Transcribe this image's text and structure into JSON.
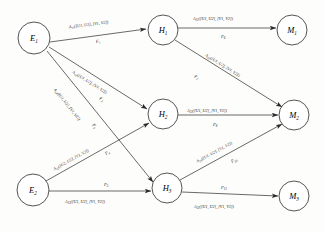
{
  "diagram": {
    "type": "directed-graph",
    "background_color": "#fdfdfb",
    "stroke_color": "#2a2a2a",
    "nodes": [
      {
        "id": "E1",
        "base": "E",
        "sub": "1",
        "label": "E1",
        "cx": 34,
        "cy": 38,
        "r": 16,
        "layer": "source"
      },
      {
        "id": "E2",
        "base": "E",
        "sub": "2",
        "label": "E2",
        "cx": 33,
        "cy": 190,
        "r": 16,
        "layer": "source"
      },
      {
        "id": "H1",
        "base": "H",
        "sub": "1",
        "label": "H1",
        "cx": 163,
        "cy": 30,
        "r": 15,
        "layer": "hidden"
      },
      {
        "id": "H2",
        "base": "H",
        "sub": "2",
        "label": "H2",
        "cx": 163,
        "cy": 114,
        "r": 15,
        "layer": "hidden"
      },
      {
        "id": "H3",
        "base": "H",
        "sub": "3",
        "label": "H3",
        "cx": 167,
        "cy": 188,
        "r": 15,
        "layer": "hidden"
      },
      {
        "id": "M1",
        "base": "M",
        "sub": "1",
        "label": "M1",
        "cx": 292,
        "cy": 30,
        "r": 15,
        "layer": "sink"
      },
      {
        "id": "M2",
        "base": "M",
        "sub": "2",
        "label": "M2",
        "cx": 294,
        "cy": 115,
        "r": 15,
        "layer": "sink"
      },
      {
        "id": "M3",
        "base": "M",
        "sub": "3",
        "label": "M3",
        "cx": 294,
        "cy": 196,
        "r": 15,
        "layer": "sink"
      }
    ],
    "edges": [
      {
        "id": "e1",
        "from": "E1",
        "to": "H1",
        "flow": "F",
        "flow_sub": "1",
        "attr_base": "A",
        "attr_sub": "11",
        "attr_args": "([U1, U2], [V1, V2])",
        "attr_text": "A11([U1, U2], [V1, V2])"
      },
      {
        "id": "e2",
        "from": "E1",
        "to": "H2",
        "flow": "F",
        "flow_sub": "2",
        "attr_base": "A",
        "attr_sub": "12",
        "attr_args": "([U1, U2], [V1, V2])",
        "attr_text": "A12([U1, U2], [V1, V2])"
      },
      {
        "id": "e3",
        "from": "E1",
        "to": "H3",
        "flow": "F",
        "flow_sub": "3",
        "attr_base": "A",
        "attr_sub": "13",
        "attr_args": "([U1, U2], [V1, V2])",
        "attr_text": "A13([U1, U2], [V1, V2])"
      },
      {
        "id": "e4",
        "from": "E2",
        "to": "H2",
        "flow": "F",
        "flow_sub": "4",
        "attr_base": "A",
        "attr_sub": "22",
        "attr_args": "([U2, U2], [V1, V2])",
        "attr_text": "A22([U2, U2], [V1, V2])"
      },
      {
        "id": "e5",
        "from": "E2",
        "to": "H3",
        "flow": "F",
        "flow_sub": "5",
        "attr_base": "A",
        "attr_sub": "13",
        "attr_args": "([U1, U2], [V1, V2])",
        "attr_text": "A13([U1, U2], [V1, V2])"
      },
      {
        "id": "e6",
        "from": "H1",
        "to": "M1",
        "flow": "F",
        "flow_sub": "6",
        "attr_base": "A",
        "attr_sub": "21",
        "attr_args": "([U1, U2], [V1, V2])",
        "attr_text": "A21([U1, U2], [V1, V2])"
      },
      {
        "id": "e7",
        "from": "H1",
        "to": "M2",
        "flow": "F",
        "flow_sub": "7",
        "attr_base": "A",
        "attr_sub": "22",
        "attr_args": "([U1, U2], [V1, V2])",
        "attr_text": "A22([U1, U2], [V1, V2])"
      },
      {
        "id": "e8",
        "from": "H2",
        "to": "M2",
        "flow": "F",
        "flow_sub": "8",
        "attr_base": "A",
        "attr_sub": "23",
        "attr_args": "([U1, U2], [V1, V2])",
        "attr_text": "A23([U1, U2], [V1, V2])"
      },
      {
        "id": "e10",
        "from": "H3",
        "to": "M2",
        "flow": "F",
        "flow_sub": "10",
        "attr_base": "A",
        "attr_sub": "24",
        "attr_args": "([U1, U2], [V1, V2])",
        "attr_text": "A24([U1, U2], [V1, V2])"
      },
      {
        "id": "e11",
        "from": "H3",
        "to": "M3",
        "flow": "F",
        "flow_sub": "11",
        "attr_base": "A",
        "attr_sub": "22",
        "attr_args": "([U1, U2], [V1, V2])",
        "attr_text": "A22([U1, U2], [V1, V2])"
      }
    ]
  }
}
